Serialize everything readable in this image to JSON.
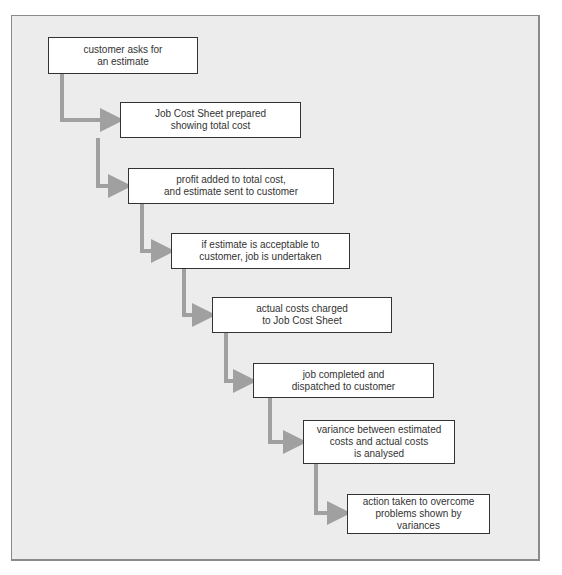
{
  "diagram": {
    "type": "flowchart",
    "layout": "staircase-top-left-to-bottom-right",
    "colors": {
      "background": "#ececec",
      "frame_border": "#8a8a8a",
      "box_fill": "#ffffff",
      "box_border": "#333333",
      "connector": "#a0a0a0",
      "text": "#333333"
    },
    "steps": [
      {
        "id": 1,
        "label": "customer asks for\nan estimate"
      },
      {
        "id": 2,
        "label": "Job Cost Sheet prepared\nshowing total cost"
      },
      {
        "id": 3,
        "label": "profit added to total cost,\nand estimate sent to customer"
      },
      {
        "id": 4,
        "label": "if estimate is acceptable to\ncustomer, job is undertaken"
      },
      {
        "id": 5,
        "label": "actual costs charged\nto Job Cost Sheet"
      },
      {
        "id": 6,
        "label": "job completed and\ndispatched to customer"
      },
      {
        "id": 7,
        "label": "variance between estimated\ncosts and actual costs\nis analysed"
      },
      {
        "id": 8,
        "label": "action taken to overcome\nproblems shown by\nvariances"
      }
    ],
    "caption": ""
  }
}
